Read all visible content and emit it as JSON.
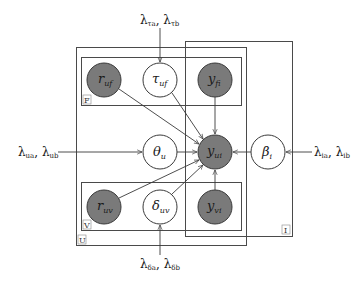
{
  "diagram": {
    "type": "probabilistic-graphical-model",
    "plates": [
      {
        "id": "U",
        "label": "U"
      },
      {
        "id": "F",
        "label": "F"
      },
      {
        "id": "V",
        "label": "V"
      },
      {
        "id": "I",
        "label": "I"
      }
    ],
    "nodes": {
      "r_uf": {
        "symbol": "r",
        "sub": "uf",
        "observed": true
      },
      "tau_uf": {
        "symbol": "τ",
        "sub": "uf",
        "observed": false
      },
      "y_fi": {
        "symbol": "y",
        "sub": "fi",
        "observed": true
      },
      "theta_u": {
        "symbol": "θ",
        "sub": "u",
        "observed": false
      },
      "y_ui": {
        "symbol": "y",
        "sub": "ui",
        "observed": true
      },
      "beta_i": {
        "symbol": "β",
        "sub": "i",
        "observed": false
      },
      "r_uv": {
        "symbol": "r",
        "sub": "uv",
        "observed": true
      },
      "delta_uv": {
        "symbol": "δ",
        "sub": "uv",
        "observed": false
      },
      "y_vi": {
        "symbol": "y",
        "sub": "vi",
        "observed": true
      }
    },
    "hyperparameters": {
      "tau": {
        "a": "λ",
        "a_sub": "τa",
        "sep": ", ",
        "b": "λ",
        "b_sub": "τb"
      },
      "theta": {
        "a": "λ",
        "a_sub": "ua",
        "sep": ", ",
        "b": "λ",
        "b_sub": "ub"
      },
      "beta": {
        "a": "λ",
        "a_sub": "ia",
        "sep": ", ",
        "b": "λ",
        "b_sub": "ib"
      },
      "delta": {
        "a": "λ",
        "a_sub": "δa",
        "sep": ", ",
        "b": "λ",
        "b_sub": "δb"
      }
    },
    "edges": [
      [
        "r_uf",
        "y_ui"
      ],
      [
        "tau_uf",
        "y_ui"
      ],
      [
        "y_fi",
        "y_ui"
      ],
      [
        "theta_u",
        "y_ui"
      ],
      [
        "beta_i",
        "y_ui"
      ],
      [
        "r_uv",
        "y_ui"
      ],
      [
        "delta_uv",
        "y_ui"
      ],
      [
        "y_vi",
        "y_ui"
      ],
      [
        "hyper.tau",
        "tau_uf"
      ],
      [
        "hyper.theta",
        "theta_u"
      ],
      [
        "hyper.beta",
        "beta_i"
      ],
      [
        "hyper.delta",
        "delta_uv"
      ]
    ],
    "colors": {
      "observed_fill": "#7a7a7a",
      "latent_fill": "#ffffff",
      "stroke": "#3a3a3a"
    }
  }
}
